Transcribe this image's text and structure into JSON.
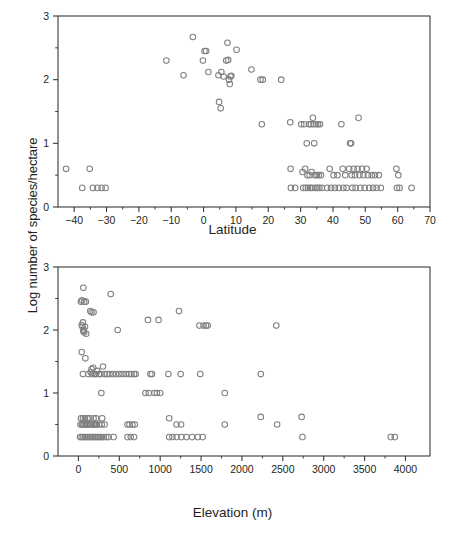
{
  "figure": {
    "y_axis_label": "Log number of species/hectare",
    "background": "#ffffff",
    "marker_color": "#808080",
    "axis_color": "#3a3a3a",
    "text_color": "#231f20"
  },
  "chart_data": [
    {
      "type": "scatter",
      "id": "latitude-panel",
      "title": "",
      "xlabel": "Latitude",
      "ylabel": "Log number of species/hectare",
      "xlim": [
        -45,
        70
      ],
      "ylim": [
        0,
        3
      ],
      "xticks": [
        -40,
        -30,
        -20,
        -10,
        0,
        10,
        20,
        30,
        40,
        50,
        60,
        70
      ],
      "xticklabels": [
        "−40",
        "−30",
        "−20",
        "−10",
        "0",
        "10",
        "20",
        "30",
        "40",
        "50",
        "60",
        "70"
      ],
      "yticks": [
        0,
        1,
        2,
        3
      ],
      "yticklabels": [
        "0",
        "1",
        "2",
        "3"
      ],
      "y_minor_ticks": [
        0.5,
        1.5,
        2.5
      ],
      "grid": false,
      "legend": null,
      "marker": "open-circle",
      "points": [
        [
          -42.5,
          0.6
        ],
        [
          -37.5,
          0.3
        ],
        [
          -35.2,
          0.6
        ],
        [
          -34.2,
          0.3
        ],
        [
          -32.8,
          0.3
        ],
        [
          -31.5,
          0.3
        ],
        [
          -30.3,
          0.3
        ],
        [
          -11.5,
          2.3
        ],
        [
          -6.2,
          2.07
        ],
        [
          -3.3,
          2.67
        ],
        [
          -0.2,
          2.3
        ],
        [
          0.3,
          2.45
        ],
        [
          0.8,
          2.45
        ],
        [
          1.5,
          2.12
        ],
        [
          4.6,
          2.07
        ],
        [
          4.8,
          1.65
        ],
        [
          5.3,
          1.55
        ],
        [
          5.5,
          2.12
        ],
        [
          6.2,
          2.05
        ],
        [
          7.0,
          2.3
        ],
        [
          7.4,
          2.58
        ],
        [
          7.6,
          2.31
        ],
        [
          7.9,
          2.0
        ],
        [
          8.1,
          1.93
        ],
        [
          8.3,
          2.05
        ],
        [
          8.6,
          2.06
        ],
        [
          10.2,
          2.47
        ],
        [
          14.8,
          2.16
        ],
        [
          17.6,
          2.0
        ],
        [
          18.0,
          1.3
        ],
        [
          18.3,
          2.0
        ],
        [
          24.0,
          2.0
        ],
        [
          26.8,
          1.33
        ],
        [
          26.9,
          0.6
        ],
        [
          27.0,
          0.3
        ],
        [
          28.3,
          0.3
        ],
        [
          30.2,
          1.3
        ],
        [
          30.6,
          0.55
        ],
        [
          30.8,
          0.3
        ],
        [
          31.1,
          1.3
        ],
        [
          31.4,
          0.6
        ],
        [
          31.6,
          0.3
        ],
        [
          31.9,
          1.0
        ],
        [
          32.1,
          0.5
        ],
        [
          32.3,
          0.3
        ],
        [
          32.6,
          1.3
        ],
        [
          32.8,
          0.5
        ],
        [
          33.0,
          0.3
        ],
        [
          33.2,
          1.3
        ],
        [
          33.4,
          0.55
        ],
        [
          33.6,
          0.3
        ],
        [
          33.8,
          1.4
        ],
        [
          34.0,
          1.3
        ],
        [
          34.2,
          1.0
        ],
        [
          34.4,
          0.5
        ],
        [
          34.6,
          0.3
        ],
        [
          34.8,
          1.3
        ],
        [
          35.0,
          0.5
        ],
        [
          35.2,
          0.3
        ],
        [
          35.4,
          1.3
        ],
        [
          35.6,
          0.5
        ],
        [
          35.8,
          0.3
        ],
        [
          36.0,
          1.3
        ],
        [
          36.3,
          0.5
        ],
        [
          36.6,
          0.3
        ],
        [
          38.2,
          0.3
        ],
        [
          39.0,
          0.6
        ],
        [
          39.4,
          0.3
        ],
        [
          40.2,
          0.5
        ],
        [
          40.6,
          0.3
        ],
        [
          41.4,
          0.5
        ],
        [
          41.8,
          0.3
        ],
        [
          42.6,
          1.3
        ],
        [
          43.0,
          0.6
        ],
        [
          43.2,
          0.3
        ],
        [
          43.8,
          0.5
        ],
        [
          44.2,
          0.3
        ],
        [
          45.0,
          0.6
        ],
        [
          45.3,
          1.0
        ],
        [
          45.6,
          1.0
        ],
        [
          45.8,
          0.5
        ],
        [
          46.0,
          0.3
        ],
        [
          46.4,
          0.6
        ],
        [
          46.8,
          0.5
        ],
        [
          47.0,
          0.3
        ],
        [
          47.6,
          0.6
        ],
        [
          47.9,
          1.4
        ],
        [
          48.2,
          0.5
        ],
        [
          48.5,
          0.3
        ],
        [
          49.0,
          0.6
        ],
        [
          49.4,
          0.5
        ],
        [
          49.8,
          0.3
        ],
        [
          50.4,
          0.6
        ],
        [
          50.8,
          0.5
        ],
        [
          51.2,
          0.3
        ],
        [
          52.0,
          0.5
        ],
        [
          52.4,
          0.3
        ],
        [
          53.0,
          0.5
        ],
        [
          53.5,
          0.3
        ],
        [
          54.2,
          0.5
        ],
        [
          54.8,
          0.3
        ],
        [
          59.6,
          0.6
        ],
        [
          59.8,
          0.3
        ],
        [
          60.2,
          0.5
        ],
        [
          60.6,
          0.3
        ],
        [
          64.3,
          0.3
        ]
      ]
    },
    {
      "type": "scatter",
      "id": "elevation-panel",
      "title": "",
      "xlabel": "Elevation (m)",
      "ylabel": "Log number of species/hectare",
      "xlim": [
        -250,
        4300
      ],
      "ylim": [
        0,
        3
      ],
      "xticks": [
        0,
        500,
        1000,
        1500,
        2000,
        2500,
        3000,
        3500,
        4000
      ],
      "xticklabels": [
        "0",
        "500",
        "1000",
        "1500",
        "2000",
        "2500",
        "3000",
        "3500",
        "4000"
      ],
      "yticks": [
        0,
        1,
        2,
        3
      ],
      "yticklabels": [
        "0",
        "1",
        "2",
        "3"
      ],
      "y_minor_ticks": [
        0.5,
        1.5,
        2.5
      ],
      "grid": false,
      "legend": null,
      "marker": "open-circle",
      "points": [
        [
          30,
          2.45
        ],
        [
          45,
          2.47
        ],
        [
          60,
          2.67
        ],
        [
          70,
          2.45
        ],
        [
          90,
          2.45
        ],
        [
          40,
          2.08
        ],
        [
          50,
          2.05
        ],
        [
          55,
          2.12
        ],
        [
          60,
          1.98
        ],
        [
          65,
          2.0
        ],
        [
          70,
          1.96
        ],
        [
          80,
          2.05
        ],
        [
          95,
          1.94
        ],
        [
          40,
          1.65
        ],
        [
          85,
          1.55
        ],
        [
          55,
          1.3
        ],
        [
          120,
          1.3
        ],
        [
          150,
          1.33
        ],
        [
          160,
          1.38
        ],
        [
          170,
          1.3
        ],
        [
          180,
          1.4
        ],
        [
          200,
          1.3
        ],
        [
          215,
          1.3
        ],
        [
          230,
          1.35
        ],
        [
          250,
          1.3
        ],
        [
          270,
          1.3
        ],
        [
          300,
          1.42
        ],
        [
          320,
          1.3
        ],
        [
          350,
          1.3
        ],
        [
          380,
          1.3
        ],
        [
          420,
          1.3
        ],
        [
          460,
          1.3
        ],
        [
          500,
          1.3
        ],
        [
          540,
          1.3
        ],
        [
          580,
          1.3
        ],
        [
          620,
          1.3
        ],
        [
          650,
          1.3
        ],
        [
          680,
          1.3
        ],
        [
          700,
          1.3
        ],
        [
          880,
          1.3
        ],
        [
          900,
          1.3
        ],
        [
          1100,
          1.3
        ],
        [
          1250,
          1.3
        ],
        [
          1490,
          1.3
        ],
        [
          2230,
          1.3
        ],
        [
          145,
          2.3
        ],
        [
          160,
          2.28
        ],
        [
          185,
          2.28
        ],
        [
          395,
          2.57
        ],
        [
          480,
          2.0
        ],
        [
          850,
          2.16
        ],
        [
          980,
          2.16
        ],
        [
          1230,
          2.3
        ],
        [
          1480,
          2.07
        ],
        [
          1530,
          2.07
        ],
        [
          1560,
          2.07
        ],
        [
          1580,
          2.07
        ],
        [
          2420,
          2.07
        ],
        [
          280,
          1.0
        ],
        [
          820,
          1.0
        ],
        [
          860,
          1.0
        ],
        [
          930,
          1.0
        ],
        [
          960,
          1.0
        ],
        [
          1000,
          1.0
        ],
        [
          1790,
          1.0
        ],
        [
          30,
          0.6
        ],
        [
          55,
          0.6
        ],
        [
          80,
          0.6
        ],
        [
          110,
          0.6
        ],
        [
          135,
          0.6
        ],
        [
          185,
          0.6
        ],
        [
          215,
          0.6
        ],
        [
          290,
          0.6
        ],
        [
          1110,
          0.6
        ],
        [
          2230,
          0.62
        ],
        [
          2730,
          0.62
        ],
        [
          25,
          0.5
        ],
        [
          45,
          0.5
        ],
        [
          60,
          0.5
        ],
        [
          75,
          0.5
        ],
        [
          95,
          0.5
        ],
        [
          110,
          0.5
        ],
        [
          130,
          0.5
        ],
        [
          145,
          0.5
        ],
        [
          165,
          0.5
        ],
        [
          185,
          0.5
        ],
        [
          200,
          0.5
        ],
        [
          220,
          0.5
        ],
        [
          250,
          0.5
        ],
        [
          285,
          0.5
        ],
        [
          320,
          0.5
        ],
        [
          195,
          0.5
        ],
        [
          215,
          0.5
        ],
        [
          600,
          0.5
        ],
        [
          625,
          0.5
        ],
        [
          660,
          0.5
        ],
        [
          690,
          0.5
        ],
        [
          1200,
          0.5
        ],
        [
          1255,
          0.5
        ],
        [
          1790,
          0.5
        ],
        [
          2430,
          0.5
        ],
        [
          20,
          0.3
        ],
        [
          40,
          0.3
        ],
        [
          60,
          0.3
        ],
        [
          80,
          0.3
        ],
        [
          100,
          0.3
        ],
        [
          120,
          0.3
        ],
        [
          140,
          0.3
        ],
        [
          160,
          0.3
        ],
        [
          180,
          0.3
        ],
        [
          200,
          0.3
        ],
        [
          220,
          0.3
        ],
        [
          240,
          0.3
        ],
        [
          260,
          0.3
        ],
        [
          285,
          0.3
        ],
        [
          310,
          0.3
        ],
        [
          340,
          0.3
        ],
        [
          370,
          0.3
        ],
        [
          430,
          0.3
        ],
        [
          600,
          0.3
        ],
        [
          640,
          0.3
        ],
        [
          680,
          0.3
        ],
        [
          1110,
          0.3
        ],
        [
          1150,
          0.3
        ],
        [
          1200,
          0.3
        ],
        [
          1260,
          0.3
        ],
        [
          1320,
          0.3
        ],
        [
          1390,
          0.3
        ],
        [
          1460,
          0.3
        ],
        [
          1520,
          0.3
        ],
        [
          2740,
          0.3
        ],
        [
          3820,
          0.3
        ],
        [
          3870,
          0.3
        ]
      ]
    }
  ]
}
